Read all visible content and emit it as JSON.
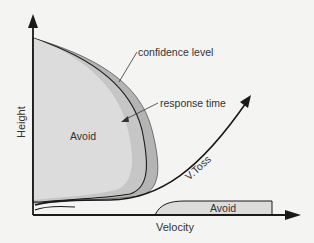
{
  "diagram": {
    "axes": {
      "x_label": "Velocity",
      "y_label": "Height"
    },
    "regions": {
      "upper_avoid": "Avoid",
      "lower_avoid": "Avoid"
    },
    "annotations": {
      "confidence": "confidence level",
      "response": "response time",
      "toss": "V.Toss"
    },
    "colors": {
      "background": "#f4f4f2",
      "avoid_fill": "#dcdcdc",
      "band_fill": "#b4b4b4",
      "line": "#1a1a1a"
    }
  }
}
